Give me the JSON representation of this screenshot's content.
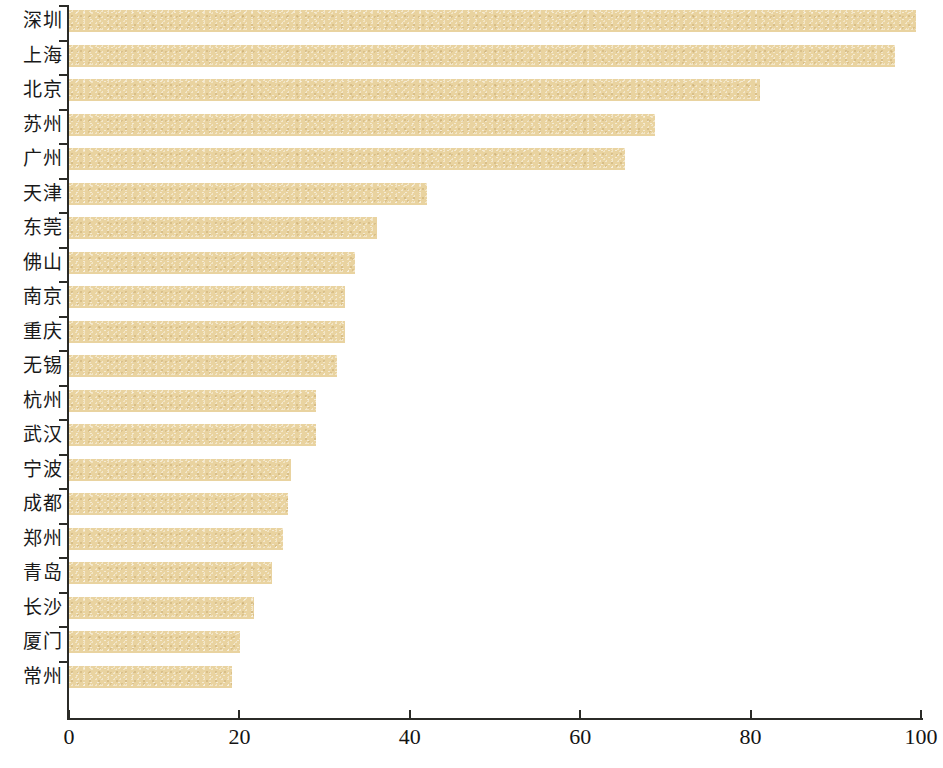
{
  "chart_data": {
    "type": "bar",
    "orientation": "horizontal",
    "title": "",
    "subtitle": "",
    "xlabel": "",
    "ylabel": "",
    "xlim": [
      0,
      100
    ],
    "xticks": [
      0,
      20,
      40,
      60,
      80,
      100
    ],
    "xtick_labels": [
      "0",
      "20",
      "40",
      "60",
      "80",
      "100"
    ],
    "grid": false,
    "legend": false,
    "bar_color": "#e9d3a0",
    "axis_color": "#2b2b28",
    "background": "#ffffff",
    "categories": [
      "深圳",
      "上海",
      "北京",
      "苏州",
      "广州",
      "天津",
      "东莞",
      "佛山",
      "南京",
      "重庆",
      "无锡",
      "杭州",
      "武汉",
      "宁波",
      "成都",
      "郑州",
      "青岛",
      "长沙",
      "厦门",
      "常州"
    ],
    "values": [
      99.4,
      97.0,
      81.1,
      68.8,
      65.2,
      42.0,
      36.2,
      33.6,
      32.4,
      32.4,
      31.5,
      29.0,
      29.0,
      26.0,
      25.7,
      25.1,
      23.8,
      21.7,
      20.1,
      19.1
    ],
    "series": [
      {
        "name": "",
        "values": [
          99.4,
          97.0,
          81.1,
          68.8,
          65.2,
          42.0,
          36.2,
          33.6,
          32.4,
          32.4,
          31.5,
          29.0,
          29.0,
          26.0,
          25.7,
          25.1,
          23.8,
          21.7,
          20.1,
          19.1
        ]
      }
    ]
  },
  "caption": {
    "text": ""
  }
}
